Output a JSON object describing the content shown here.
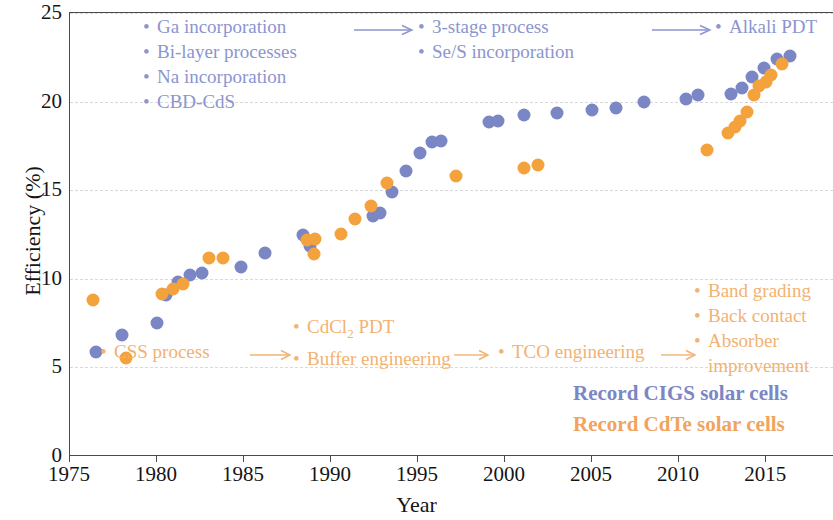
{
  "chart_data": {
    "type": "scatter",
    "title": "",
    "xlabel": "Year",
    "ylabel": "Efficiency (%)",
    "xlim": [
      1975,
      2018.9
    ],
    "ylim": [
      0,
      25
    ],
    "xticks": [
      1975,
      1980,
      1985,
      1990,
      1995,
      2000,
      2005,
      2010,
      2015
    ],
    "yticks": [
      0,
      5,
      10,
      15,
      20,
      25
    ],
    "grid": "horizontal-dashed",
    "legend_position": "in-plot-bottom-right",
    "series": [
      {
        "name": "Record CIGS solar cells",
        "color": "#7b86c4",
        "points": [
          [
            1976.5,
            5.85
          ],
          [
            1978.0,
            6.85
          ],
          [
            1980.0,
            7.5
          ],
          [
            1980.5,
            9.1
          ],
          [
            1981.2,
            9.8
          ],
          [
            1981.9,
            10.2
          ],
          [
            1982.6,
            10.35
          ],
          [
            1984.8,
            10.65
          ],
          [
            1986.2,
            11.45
          ],
          [
            1988.4,
            12.45
          ],
          [
            1988.8,
            11.85
          ],
          [
            1992.4,
            13.55
          ],
          [
            1992.8,
            13.7
          ],
          [
            1993.5,
            14.9
          ],
          [
            1994.3,
            16.1
          ],
          [
            1995.1,
            17.1
          ],
          [
            1995.8,
            17.7
          ],
          [
            1996.3,
            17.75
          ],
          [
            1999.1,
            18.85
          ],
          [
            1999.6,
            18.9
          ],
          [
            2001.1,
            19.25
          ],
          [
            2003.0,
            19.35
          ],
          [
            2005.0,
            19.5
          ],
          [
            2006.4,
            19.65
          ],
          [
            2008.0,
            20.0
          ],
          [
            2010.4,
            20.15
          ],
          [
            2011.1,
            20.4
          ],
          [
            2013.0,
            20.45
          ],
          [
            2013.6,
            20.75
          ],
          [
            2014.2,
            21.4
          ],
          [
            2014.9,
            21.9
          ],
          [
            2015.6,
            22.4
          ],
          [
            2016.4,
            22.6
          ]
        ]
      },
      {
        "name": "Record CdTe solar cells",
        "color": "#f4a23c",
        "points": [
          [
            1976.3,
            8.8
          ],
          [
            1978.2,
            5.55
          ],
          [
            1980.3,
            9.15
          ],
          [
            1980.9,
            9.45
          ],
          [
            1981.5,
            9.7
          ],
          [
            1983.0,
            11.15
          ],
          [
            1983.8,
            11.2
          ],
          [
            1988.6,
            12.2
          ],
          [
            1989.1,
            12.25
          ],
          [
            1989.0,
            11.4
          ],
          [
            1990.6,
            12.55
          ],
          [
            1991.4,
            13.35
          ],
          [
            1992.3,
            14.1
          ],
          [
            1993.2,
            15.4
          ],
          [
            1997.2,
            15.8
          ],
          [
            2001.1,
            16.25
          ],
          [
            2001.9,
            16.45
          ],
          [
            2011.6,
            17.25
          ],
          [
            2012.8,
            18.2
          ],
          [
            2013.2,
            18.55
          ],
          [
            2013.5,
            18.9
          ],
          [
            2013.9,
            19.4
          ],
          [
            2014.3,
            20.4
          ],
          [
            2014.6,
            20.9
          ],
          [
            2015.0,
            21.1
          ],
          [
            2015.3,
            21.5
          ],
          [
            2015.9,
            22.1
          ]
        ]
      }
    ]
  },
  "axis": {
    "xlabel": "Year",
    "ylabel": "Efficiency (%)",
    "xticklabels": [
      "1975",
      "1980",
      "1985",
      "1990",
      "1995",
      "2000",
      "2005",
      "2010",
      "2015"
    ],
    "yticklabels": [
      "0",
      "5",
      "10",
      "15",
      "20",
      "25"
    ]
  },
  "annotations": {
    "cigs_group_1": {
      "items": [
        "Ga incorporation",
        "Bi-layer processes",
        "Na incorporation",
        "CBD-CdS"
      ],
      "bullet": "•"
    },
    "cigs_group_2": {
      "items": [
        "3-stage process",
        "Se/S incorporation"
      ],
      "bullet": "•"
    },
    "cigs_group_3": {
      "items": [
        "Alkali PDT"
      ],
      "bullet": "•"
    },
    "cdte_group_1": {
      "items": [
        "CSS process"
      ],
      "bullet": "•"
    },
    "cdte_group_2": {
      "items": [
        "CdCl2 PDT",
        "Buffer engineering"
      ],
      "item_1_main": "CdCl",
      "item_1_sub": "2",
      "item_1_tail": " PDT",
      "bullet": "•"
    },
    "cdte_group_3": {
      "items": [
        "TCO engineering"
      ],
      "bullet": "•"
    },
    "cdte_group_4": {
      "items": [
        "Band grading",
        "Back contact",
        "Absorber",
        "improvement"
      ],
      "bullet": "•"
    }
  },
  "legend": {
    "cigs": "Record CIGS solar cells",
    "cdte": "Record CdTe solar cells"
  },
  "colors": {
    "cigs": "#7b86c4",
    "cdte": "#f4a23c",
    "cigs_text": "#8b95cf",
    "cdte_text": "#f2b272",
    "axis": "#4a4a4a",
    "grid": "#d9d9d9"
  }
}
